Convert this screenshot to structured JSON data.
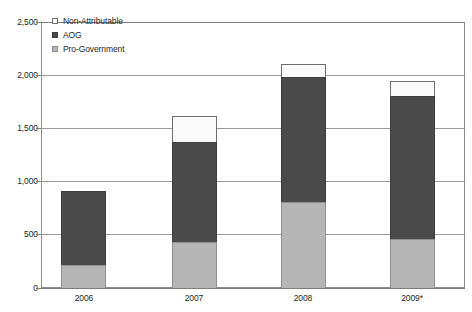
{
  "chart_data": {
    "type": "bar",
    "subtype": "stacked-vertical",
    "title": "",
    "subtitle": "",
    "xlabel": "",
    "ylabel": "",
    "categories": [
      "2006",
      "2007",
      "2008",
      "2009*"
    ],
    "series": [
      {
        "name": "Pro-Government",
        "key": "progov",
        "color": "#b5b5b5",
        "values": [
          220,
          430,
          810,
          460
        ]
      },
      {
        "name": "AOG",
        "key": "aog",
        "color": "#4a4a4a",
        "values": [
          705,
          955,
          1180,
          1350
        ]
      },
      {
        "name": "Non-Attributable",
        "key": "nonattr",
        "color": "#ffffff",
        "values": [
          0,
          255,
          130,
          150
        ]
      }
    ],
    "totals": [
      925,
      1640,
      2120,
      1960
    ],
    "stack_order_bottom_to_top": [
      "Pro-Government",
      "AOG",
      "Non-Attributable"
    ],
    "ylim": [
      0,
      2500
    ],
    "yticks": [
      0,
      500,
      1000,
      1500,
      2000,
      2500
    ],
    "ytick_labels": [
      "0",
      "500",
      "1,000",
      "1,500",
      "2,000",
      "2,500"
    ],
    "grid": true,
    "grid_axis": "y",
    "legend_position": "top-left-inside"
  },
  "legend": {
    "items": [
      {
        "label": "Non-Attributable",
        "swatch_class": "sw-nonattr",
        "icon": "legend-swatch-white"
      },
      {
        "label": "AOG",
        "swatch_class": "sw-aog",
        "icon": "legend-swatch-dark"
      },
      {
        "label": "Pro-Government",
        "swatch_class": "sw-progov",
        "icon": "legend-swatch-gray"
      }
    ]
  },
  "axes": {
    "y_tick_labels": [
      "2,500",
      "2,000",
      "1,500",
      "1,000",
      "500",
      "0"
    ],
    "x_tick_labels": [
      "2006",
      "2007",
      "2008",
      "2009*"
    ]
  },
  "colors": {
    "non_attributable": "#fafafa",
    "aog": "#4a4a4a",
    "pro_government": "#b5b5b5",
    "gridline": "#9a9a9a",
    "frame": "#8d8d8d",
    "text": "#231f20"
  }
}
